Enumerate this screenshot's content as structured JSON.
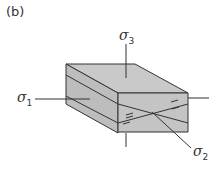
{
  "panel_label": "(b)",
  "stress_labels": {
    "sigma1": {
      "symbol": "σ",
      "sub": "1"
    },
    "sigma2": {
      "symbol": "σ",
      "sub": "2"
    },
    "sigma3": {
      "symbol": "σ",
      "sub": "3"
    }
  },
  "colors": {
    "face_top": "#c9c9c9",
    "face_side": "#bdbdbd",
    "face_front": "#c4c4c4",
    "line": "#333333"
  }
}
